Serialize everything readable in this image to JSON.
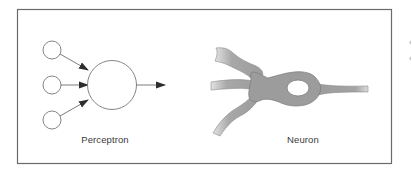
{
  "figure": {
    "panels": [
      {
        "id": "perceptron",
        "label": "Perceptron"
      },
      {
        "id": "neuron",
        "label": "Neuron"
      }
    ],
    "perceptron": {
      "input_nodes": 3,
      "output_arrows": 1
    },
    "colors": {
      "frame": "#6a6a6a",
      "line": "#6e6e6e",
      "arrowhead": "#2e2e2e",
      "neuron_fill": "#9c9c9c",
      "neuron_outline": "#7a7a7a",
      "label_text": "#3a3a3a",
      "background": "#ffffff"
    }
  }
}
